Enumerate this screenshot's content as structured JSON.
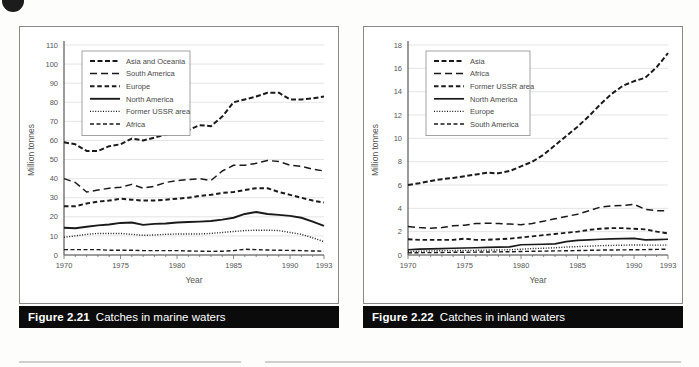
{
  "page": {
    "corner_marker": "page-corner-dot"
  },
  "figures": [
    {
      "id": "figure-2-21",
      "caption_number": "Figure 2.21",
      "caption_text": "Catches in marine waters",
      "chart_data": {
        "type": "line",
        "title": "Catches in marine waters",
        "xlabel": "Year",
        "ylabel": "Million tonnes",
        "xlim": [
          1970,
          1993
        ],
        "ylim": [
          0,
          110
        ],
        "ytick_step": 10,
        "yticks": [
          0,
          10,
          20,
          30,
          40,
          50,
          60,
          70,
          80,
          90,
          100,
          110
        ],
        "xticks": [
          1970,
          1975,
          1980,
          1985,
          1990,
          1993
        ],
        "grid": true,
        "legend_position": "top-left",
        "x": [
          1970,
          1971,
          1972,
          1973,
          1974,
          1975,
          1976,
          1977,
          1978,
          1979,
          1980,
          1981,
          1982,
          1983,
          1984,
          1985,
          1986,
          1987,
          1988,
          1989,
          1990,
          1991,
          1992,
          1993
        ],
        "series": [
          {
            "name": "Asia and Oceania",
            "dash": "5,2.5",
            "width": 2.0,
            "values": [
              59,
              58,
              54.5,
              54.5,
              57,
              58,
              61,
              60,
              61.5,
              63,
              64,
              65.5,
              68,
              67.5,
              72.5,
              80,
              81.5,
              83,
              85,
              85,
              81.5,
              81.5,
              82,
              83
            ]
          },
          {
            "name": "South America",
            "dash": "7,4",
            "width": 1.5,
            "values": [
              40,
              38,
              33,
              34,
              35,
              35.5,
              37,
              35,
              36,
              38,
              39,
              39.5,
              40,
              39,
              44,
              47,
              47,
              48,
              49.5,
              49,
              47,
              46.5,
              45,
              44
            ]
          },
          {
            "name": "Europe",
            "dash": "4.5,2.8",
            "width": 2.0,
            "values": [
              25.5,
              25.5,
              27,
              28,
              28.5,
              29.5,
              29,
              28.5,
              28.5,
              29,
              29.5,
              30,
              31,
              31.5,
              32.5,
              33,
              34,
              35,
              35,
              33,
              31.5,
              30,
              28.5,
              27.5
            ]
          },
          {
            "name": "North America",
            "dash": "none",
            "width": 1.9,
            "values": [
              14.3,
              14,
              14.8,
              15.5,
              16,
              16.8,
              17,
              15.8,
              16.3,
              16.5,
              17,
              17.3,
              17.5,
              17.8,
              18.5,
              19.5,
              21.5,
              22.5,
              21.5,
              21,
              20.5,
              19.5,
              17.5,
              15.3
            ]
          },
          {
            "name": "Former USSR area",
            "dash": "1,1.6",
            "width": 1.4,
            "values": [
              9.3,
              10,
              10.8,
              11.3,
              11.3,
              11.3,
              10.8,
              10.3,
              10.5,
              10.8,
              11,
              11,
              11,
              11.3,
              11.8,
              12.3,
              12.8,
              13,
              13,
              12.8,
              11.8,
              10.8,
              9,
              7
            ]
          },
          {
            "name": "Africa",
            "dash": "4,2.5",
            "width": 1.4,
            "values": [
              2.8,
              2.8,
              2.8,
              2.8,
              2.5,
              2.5,
              2.5,
              2.3,
              2.3,
              2.3,
              2.3,
              2.1,
              2,
              1.9,
              2,
              2.3,
              3,
              2.8,
              2.6,
              2.5,
              2.4,
              2.3,
              2.1,
              2
            ]
          }
        ]
      }
    },
    {
      "id": "figure-2-22",
      "caption_number": "Figure 2.22",
      "caption_text": "Catches in inland waters",
      "chart_data": {
        "type": "line",
        "title": "Catches in inland waters",
        "xlabel": "Year",
        "ylabel": "Million tonnes",
        "xlim": [
          1970,
          1993
        ],
        "ylim": [
          0,
          18
        ],
        "ytick_step": 2,
        "yticks": [
          0,
          2,
          4,
          6,
          8,
          10,
          12,
          14,
          16,
          18
        ],
        "xticks": [
          1970,
          1975,
          1980,
          1985,
          1990,
          1993
        ],
        "grid": true,
        "legend_position": "top-left",
        "x": [
          1970,
          1971,
          1972,
          1973,
          1974,
          1975,
          1976,
          1977,
          1978,
          1979,
          1980,
          1981,
          1982,
          1983,
          1984,
          1985,
          1986,
          1987,
          1988,
          1989,
          1990,
          1991,
          1992,
          1993
        ],
        "series": [
          {
            "name": "Asia",
            "dash": "5,2.5",
            "width": 2.0,
            "values": [
              6.0,
              6.15,
              6.35,
              6.5,
              6.6,
              6.75,
              6.9,
              7.05,
              7.0,
              7.2,
              7.6,
              8.0,
              8.6,
              9.4,
              10.2,
              11.0,
              11.9,
              12.9,
              13.8,
              14.5,
              14.9,
              15.2,
              16.1,
              17.3
            ]
          },
          {
            "name": "Africa",
            "dash": "7,4",
            "width": 1.5,
            "values": [
              2.45,
              2.35,
              2.3,
              2.35,
              2.5,
              2.55,
              2.7,
              2.72,
              2.7,
              2.65,
              2.6,
              2.7,
              2.9,
              3.1,
              3.3,
              3.5,
              3.8,
              4.1,
              4.2,
              4.25,
              4.35,
              3.9,
              3.8,
              3.8
            ]
          },
          {
            "name": "Former USSR area",
            "dash": "4.5,2.8",
            "width": 1.9,
            "values": [
              1.35,
              1.3,
              1.3,
              1.3,
              1.3,
              1.4,
              1.3,
              1.3,
              1.35,
              1.4,
              1.5,
              1.6,
              1.7,
              1.8,
              1.9,
              2.0,
              2.15,
              2.25,
              2.3,
              2.3,
              2.25,
              2.2,
              2.0,
              1.85
            ]
          },
          {
            "name": "North America",
            "dash": "none",
            "width": 1.7,
            "values": [
              0.45,
              0.5,
              0.52,
              0.55,
              0.58,
              0.6,
              0.62,
              0.65,
              0.68,
              0.7,
              0.88,
              0.9,
              0.92,
              0.95,
              1.15,
              1.25,
              1.3,
              1.35,
              1.38,
              1.4,
              1.42,
              1.3,
              1.32,
              1.35
            ]
          },
          {
            "name": "Europe",
            "dash": "1,1.6",
            "width": 1.4,
            "values": [
              0.3,
              0.33,
              0.35,
              0.37,
              0.38,
              0.4,
              0.4,
              0.42,
              0.43,
              0.45,
              0.5,
              0.55,
              0.58,
              0.62,
              0.68,
              0.72,
              0.76,
              0.8,
              0.82,
              0.84,
              0.86,
              0.85,
              0.85,
              0.85
            ]
          },
          {
            "name": "South America",
            "dash": "4,2.5",
            "width": 1.4,
            "values": [
              0.18,
              0.2,
              0.2,
              0.22,
              0.23,
              0.24,
              0.25,
              0.26,
              0.27,
              0.28,
              0.3,
              0.32,
              0.33,
              0.35,
              0.36,
              0.38,
              0.4,
              0.42,
              0.43,
              0.44,
              0.45,
              0.46,
              0.48,
              0.5
            ]
          }
        ]
      }
    }
  ]
}
